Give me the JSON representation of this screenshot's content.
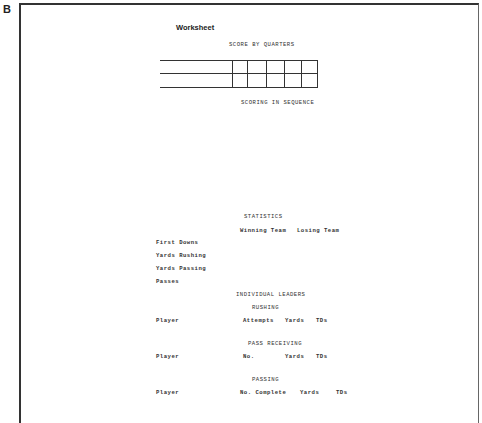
{
  "figure_label": "B",
  "worksheet": {
    "title": "Worksheet",
    "score_by_quarters": {
      "heading": "SCORE BY QUARTERS",
      "rows": 2,
      "columns": 5
    },
    "scoring_in_sequence": {
      "heading": "SCORING IN SEQUENCE"
    },
    "statistics": {
      "heading": "STATISTICS",
      "columns": [
        "Winning Team",
        "Losing Team"
      ],
      "rows": [
        "First Downs",
        "Yards Rushing",
        "Yards Passing",
        "Passes"
      ]
    },
    "individual_leaders": {
      "heading": "INDIVIDUAL LEADERS",
      "rushing": {
        "heading": "RUSHING",
        "row_label": "Player",
        "columns": [
          "Attempts",
          "Yards",
          "TDs"
        ]
      },
      "pass_receiving": {
        "heading": "PASS RECEIVING",
        "row_label": "Player",
        "columns": [
          "No.",
          "Yards",
          "TDs"
        ]
      },
      "passing": {
        "heading": "PASSING",
        "row_label": "Player",
        "columns": [
          "No. Complete",
          "Yards",
          "TDs"
        ]
      }
    }
  }
}
